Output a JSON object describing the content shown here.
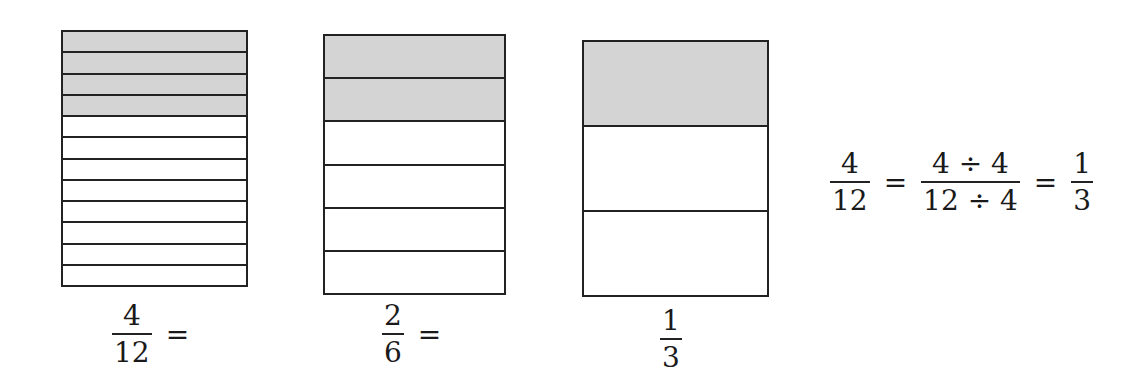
{
  "models": [
    {
      "id": "twelfths",
      "parts": 12,
      "shaded": 4,
      "fraction": {
        "numerator": "4",
        "denominator": "12"
      },
      "suffix": "="
    },
    {
      "id": "sixths",
      "parts": 6,
      "shaded": 2,
      "fraction": {
        "numerator": "2",
        "denominator": "6"
      },
      "suffix": "="
    },
    {
      "id": "thirds",
      "parts": 3,
      "shaded": 1,
      "fraction": {
        "numerator": "1",
        "denominator": "3"
      },
      "suffix": ""
    }
  ],
  "equation": {
    "left": {
      "numerator": "4",
      "denominator": "12"
    },
    "eq1": "=",
    "middle": {
      "numerator": "4 ÷ 4",
      "denominator": "12 ÷ 4"
    },
    "eq2": "=",
    "right": {
      "numerator": "1",
      "denominator": "3"
    }
  },
  "colors": {
    "shaded": "#d4d4d4",
    "line": "#222222"
  }
}
